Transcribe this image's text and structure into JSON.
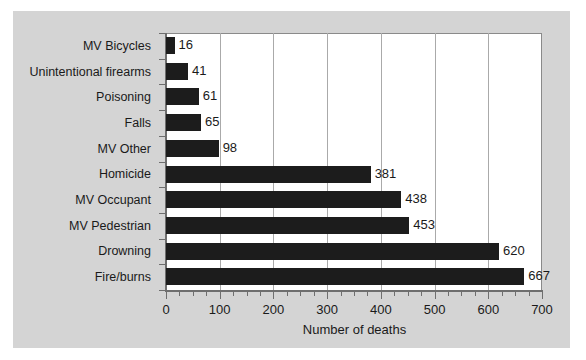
{
  "chart_data": {
    "type": "bar",
    "orientation": "horizontal",
    "title": "",
    "xlabel": "Number of deaths",
    "ylabel": "",
    "categories": [
      "MV  Bicycles",
      "Unintentional firearms",
      "Poisoning",
      "Falls",
      "MV Other",
      "Homicide",
      "MV Occupant",
      "MV Pedestrian",
      "Drowning",
      "Fire/burns"
    ],
    "values": [
      16,
      41,
      61,
      65,
      98,
      381,
      438,
      453,
      620,
      667
    ],
    "data_labels": [
      "16",
      "41",
      "61",
      "65",
      "98",
      "381",
      "438",
      "453",
      "620",
      "667"
    ],
    "xlim": [
      0,
      700
    ],
    "ylim": [
      0,
      10
    ],
    "xticks": [
      0,
      100,
      200,
      300,
      400,
      500,
      600,
      700
    ],
    "xtick_labels": [
      "0",
      "100",
      "200",
      "300",
      "400",
      "500",
      "600",
      "700"
    ],
    "minor_tick_interval": 25,
    "grid": "vertical",
    "legend": null,
    "bar_color": "#1c1c1c",
    "plot_background": "#ffffff",
    "figure_background": "#d4d4d4",
    "gridline_color": "#aaaaaa",
    "axis_color": "#6e6e6e"
  }
}
